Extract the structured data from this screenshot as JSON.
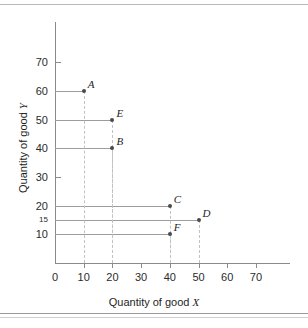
{
  "chart_data": {
    "type": "scatter",
    "title": "",
    "xlabel": "Quantity of good X",
    "ylabel": "Quantity of good Y",
    "xlim": [
      0,
      78
    ],
    "ylim": [
      0,
      78
    ],
    "xticks": [
      0,
      10,
      20,
      30,
      40,
      50,
      60,
      70
    ],
    "xtick_labels": [
      "0",
      "10",
      "20",
      "30",
      "40",
      "50",
      "60",
      "70"
    ],
    "yticks": [
      10,
      15,
      20,
      30,
      40,
      50,
      60,
      70
    ],
    "ytick_labels": [
      "10",
      "15",
      "20",
      "30",
      "40",
      "50",
      "60",
      "70"
    ],
    "grid": false,
    "legend": "none",
    "points": [
      {
        "label": "A",
        "x": 10,
        "y": 60
      },
      {
        "label": "E",
        "x": 20,
        "y": 50
      },
      {
        "label": "B",
        "x": 20,
        "y": 40
      },
      {
        "label": "C",
        "x": 40,
        "y": 20
      },
      {
        "label": "D",
        "x": 50,
        "y": 15
      },
      {
        "label": "F",
        "x": 40,
        "y": 10
      }
    ],
    "annotations": [
      "Each point has a solid horizontal leader line to the Y axis and a dashed vertical drop line to the X axis."
    ],
    "colors": {
      "background": "#ffffff",
      "axis": "#8a8a8a",
      "leader_line": "#9d9d9d",
      "drop_line": "#c2c2c2",
      "marker": "#4a4a4a",
      "text": "#1e1e1e"
    }
  },
  "axis_titles": {
    "x_prefix": "Quantity of good ",
    "x_var": "X",
    "y_prefix": "Quantity of good ",
    "y_var": "Y"
  }
}
